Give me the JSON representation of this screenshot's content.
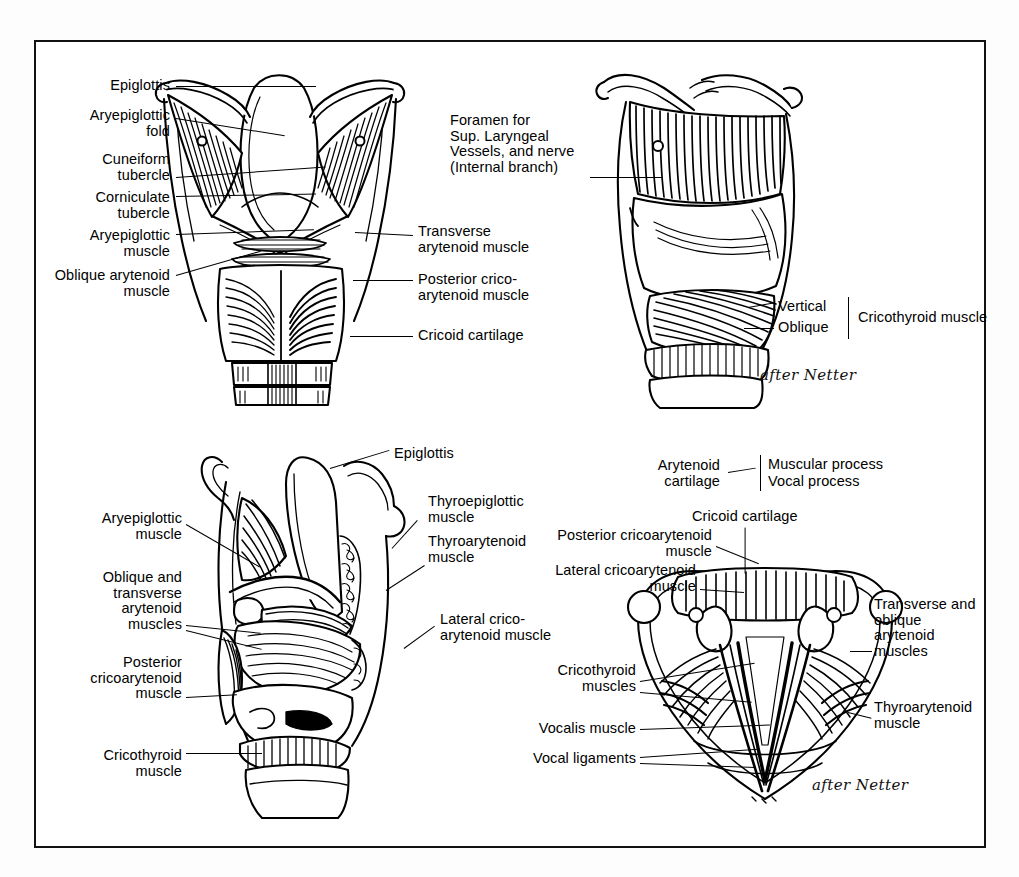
{
  "page": {
    "border_color": "#111111",
    "background": "#ffffff",
    "attribution_note": "after Netter"
  },
  "figures": [
    {
      "id": "posterior-view",
      "name": "Posterior view of the larynx",
      "attribution": "",
      "labels_left": [
        "Epiglottis",
        "Aryepiglottic\nfold",
        "Cuneiform\ntubercle",
        "Corniculate\ntubercle",
        "Aryepiglottic\nmuscle",
        "Oblique arytenoid\nmuscle"
      ],
      "labels_right": [
        "Transverse\narytenoid muscle",
        "Posterior crico-\narytenoid muscle",
        "Cricoid cartilage"
      ]
    },
    {
      "id": "lateral-view",
      "name": "Lateral view of the larynx",
      "attribution": "after Netter",
      "labels_left": [
        "Foramen for\nSup. Laryngeal\nVessels, and nerve\n(Internal branch)"
      ],
      "brace_group": {
        "items": [
          "Vertical",
          "Oblique"
        ],
        "group_label": "Cricothyroid muscle"
      }
    },
    {
      "id": "sagittal-cutaway-view",
      "name": "Sagittal cut-away view of the larynx",
      "attribution": "",
      "labels_left": [
        "Aryepiglottic\nmuscle",
        "Oblique and\ntransverse\narytenoid\nmuscles",
        "Posterior\ncricoarytenoid\nmuscle",
        "Cricothyroid\nmuscle"
      ],
      "labels_right": [
        "Epiglottis",
        "Thyroepiglottic\nmuscle",
        "Thyroarytenoid\nmuscle",
        "Lateral crico-\narytenoid muscle"
      ]
    },
    {
      "id": "superior-view",
      "name": "Superior view of the vocal folds",
      "attribution": "after Netter",
      "labels_top": [
        "Cricoid cartilage"
      ],
      "brace_group": {
        "label": "Arytenoid\ncartilage",
        "items": [
          "Muscular process",
          "Vocal process"
        ]
      },
      "labels_left": [
        "Posterior cricoarytenoid\nmuscle",
        "Lateral cricoarytenoid\nmuscle",
        "Cricothyroid\nmuscles",
        "Vocalis muscle",
        "Vocal ligaments"
      ],
      "labels_right": [
        "Transverse and\noblique\narytenoid\nmuscles",
        "Thyroarytenoid\nmuscle"
      ]
    }
  ]
}
